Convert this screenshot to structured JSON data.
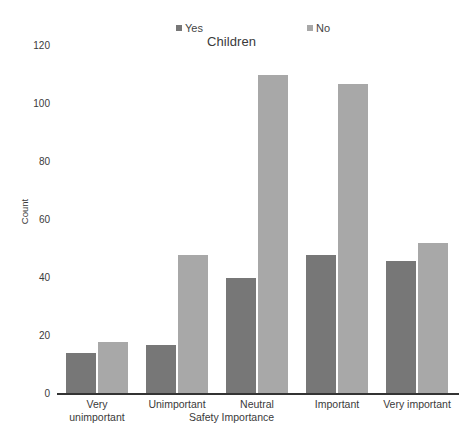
{
  "chart_data": {
    "type": "bar",
    "title": "Children",
    "xlabel": "Safety Importance",
    "ylabel": "Count",
    "categories": [
      "Very unimportant",
      "Unimportant",
      "Neutral",
      "Important",
      "Very important"
    ],
    "category_lines": [
      [
        "Very",
        "unimportant"
      ],
      [
        "Unimportant"
      ],
      [
        "Neutral"
      ],
      [
        "Important"
      ],
      [
        "Very important"
      ]
    ],
    "series": [
      {
        "name": "Yes",
        "color": "#777777",
        "values": [
          14,
          17,
          40,
          48,
          46
        ]
      },
      {
        "name": "No",
        "color": "#a8a8a8",
        "values": [
          18,
          48,
          110,
          107,
          52
        ]
      }
    ],
    "ylim": [
      0,
      120
    ],
    "yticks": [
      0,
      20,
      40,
      60,
      80,
      100,
      120
    ],
    "ytick_labels": [
      "0",
      "20",
      "40",
      "60",
      "80",
      "100",
      "120"
    ],
    "grid": false,
    "legend_position": "top",
    "bar_grouping": "grouped"
  },
  "legend": {
    "entries": [
      {
        "label": "Yes",
        "color": "#777777"
      },
      {
        "label": "No",
        "color": "#a8a8a8"
      }
    ]
  }
}
